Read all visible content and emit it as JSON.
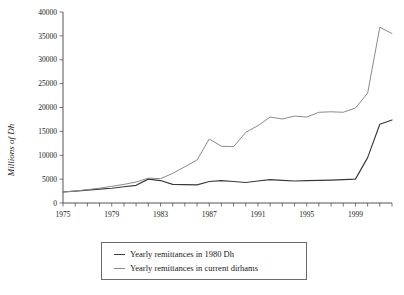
{
  "chart_data": {
    "type": "line",
    "title": "",
    "xlabel": "",
    "ylabel": "Millions of Dh",
    "xlim": [
      1975,
      2002
    ],
    "ylim": [
      0,
      40000
    ],
    "ytick_labels": [
      "0",
      "5000",
      "10000",
      "15000",
      "20000",
      "25000",
      "30000",
      "35000",
      "40000"
    ],
    "ytick_values": [
      0,
      5000,
      10000,
      15000,
      20000,
      25000,
      30000,
      35000,
      40000
    ],
    "xtick_labels": [
      "1975",
      "1979",
      "1983",
      "1987",
      "1991",
      "1995",
      "1999"
    ],
    "xtick_values": [
      1975,
      1979,
      1983,
      1987,
      1991,
      1995,
      1999
    ],
    "minor_xticks": [
      1975,
      1976,
      1977,
      1978,
      1979,
      1980,
      1981,
      1982,
      1983,
      1984,
      1985,
      1986,
      1987,
      1988,
      1989,
      1990,
      1991,
      1992,
      1993,
      1994,
      1995,
      1996,
      1997,
      1998,
      1999,
      2000,
      2001,
      2002
    ],
    "grid": false,
    "legend_position": "below-center",
    "x": [
      1975,
      1976,
      1977,
      1978,
      1979,
      1980,
      1981,
      1982,
      1983,
      1984,
      1985,
      1986,
      1987,
      1988,
      1989,
      1990,
      1991,
      1992,
      1993,
      1994,
      1995,
      1996,
      1997,
      1998,
      1999,
      2000,
      2001,
      2002
    ],
    "series": [
      {
        "name": "Yearly remittances in 1980 Dh",
        "color": "#3a3a3a",
        "values": [
          2300,
          2500,
          2700,
          2900,
          3100,
          3400,
          3700,
          5000,
          4700,
          3900,
          3850,
          3800,
          4500,
          4700,
          4500,
          4300,
          4600,
          4900,
          4750,
          4600,
          4700,
          4750,
          4800,
          4900,
          5000,
          9500,
          16500,
          17400
        ]
      },
      {
        "name": "Yearly remittances in current dirhams",
        "color": "#8a8a8a",
        "values": [
          2300,
          2500,
          2800,
          3100,
          3500,
          3900,
          4400,
          5200,
          5100,
          6200,
          7600,
          9000,
          13400,
          11900,
          11800,
          14800,
          16200,
          18000,
          17600,
          18200,
          18000,
          19000,
          19100,
          19000,
          19900,
          23000,
          36800,
          35500
        ]
      }
    ]
  },
  "legend": {
    "entries": [
      {
        "label": "Yearly remittances in 1980 Dh",
        "color": "#3a3a3a"
      },
      {
        "label": "Yearly remittances in current dirhams",
        "color": "#8a8a8a"
      }
    ]
  }
}
